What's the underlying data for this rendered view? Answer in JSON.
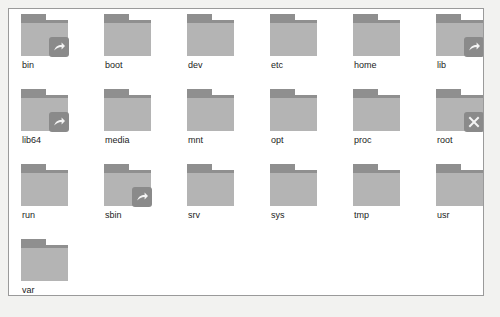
{
  "window": {
    "title": "File Manager",
    "panel_background": "#ffffff",
    "page_background": "#f2f2f0",
    "border_color": "#9a9a9a"
  },
  "view": {
    "layout": "icon-grid",
    "columns": 6,
    "rows": 4,
    "item_count": 19,
    "folder_tab_color": "#8f8f8f",
    "folder_body_color": "#b4b4b4",
    "badge_color": "#8a8a8a",
    "label_color": "#1c1c1c"
  },
  "items": [
    {
      "label": "bin",
      "icon": "folder-icon",
      "emblem": "symlink-arrow-icon"
    },
    {
      "label": "boot",
      "icon": "folder-icon",
      "emblem": null
    },
    {
      "label": "dev",
      "icon": "folder-icon",
      "emblem": null
    },
    {
      "label": "etc",
      "icon": "folder-icon",
      "emblem": null
    },
    {
      "label": "home",
      "icon": "folder-icon",
      "emblem": null
    },
    {
      "label": "lib",
      "icon": "folder-icon",
      "emblem": "symlink-arrow-icon"
    },
    {
      "label": "lib64",
      "icon": "folder-icon",
      "emblem": "symlink-arrow-icon"
    },
    {
      "label": "media",
      "icon": "folder-icon",
      "emblem": null
    },
    {
      "label": "mnt",
      "icon": "folder-icon",
      "emblem": null
    },
    {
      "label": "opt",
      "icon": "folder-icon",
      "emblem": null
    },
    {
      "label": "proc",
      "icon": "folder-icon",
      "emblem": null
    },
    {
      "label": "root",
      "icon": "folder-icon",
      "emblem": "access-denied-x-icon"
    },
    {
      "label": "run",
      "icon": "folder-icon",
      "emblem": null
    },
    {
      "label": "sbin",
      "icon": "folder-icon",
      "emblem": "symlink-arrow-icon"
    },
    {
      "label": "srv",
      "icon": "folder-icon",
      "emblem": null
    },
    {
      "label": "sys",
      "icon": "folder-icon",
      "emblem": null
    },
    {
      "label": "tmp",
      "icon": "folder-icon",
      "emblem": null
    },
    {
      "label": "usr",
      "icon": "folder-icon",
      "emblem": null
    },
    {
      "label": "var",
      "icon": "folder-icon",
      "emblem": null
    }
  ]
}
